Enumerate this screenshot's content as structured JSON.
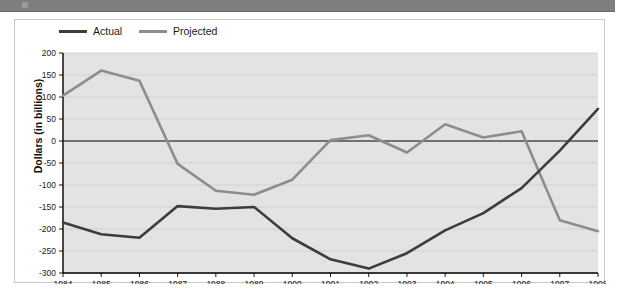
{
  "banner": {
    "name": "top-gray-banner",
    "color": "#7f7f7f"
  },
  "legend": {
    "position": "top-left",
    "entries": [
      {
        "label": "Actual",
        "color": "#3c3c3c"
      },
      {
        "label": "Projected",
        "color": "#8d8d8d"
      }
    ]
  },
  "chart_data": {
    "type": "line",
    "title": "",
    "xlabel": "",
    "ylabel": "Dollars (in billions)",
    "categories": [
      "1984",
      "1985",
      "1986",
      "1987",
      "1988",
      "1989",
      "1990",
      "1991",
      "1992",
      "1993",
      "1994",
      "1995",
      "1996",
      "1997",
      "1998"
    ],
    "x": [
      1984,
      1985,
      1986,
      1987,
      1988,
      1989,
      1990,
      1991,
      1992,
      1993,
      1994,
      1995,
      1996,
      1997,
      1998
    ],
    "series": [
      {
        "name": "Actual",
        "color": "#3c3c3c",
        "values": [
          -185,
          -212,
          -220,
          -148,
          -154,
          -150,
          -221,
          -269,
          -290,
          -255,
          -203,
          -164,
          -107,
          -22,
          73
        ]
      },
      {
        "name": "Projected",
        "color": "#8d8d8d",
        "values": [
          103,
          160,
          137,
          -52,
          -113,
          -122,
          -88,
          2,
          13,
          -26,
          38,
          8,
          22,
          -180,
          -205
        ]
      }
    ],
    "ylim": [
      -300,
      200
    ],
    "ytick_values": [
      200,
      150,
      100,
      50,
      0,
      -50,
      -100,
      -150,
      -200,
      -250,
      -300
    ],
    "ytick_labels": [
      "200",
      "150",
      "100",
      "50",
      "0",
      "-50",
      "-100",
      "-150",
      "-200",
      "-250",
      "-300"
    ],
    "grid": true,
    "grid_axis": "y",
    "legend_position": "top-left",
    "plot_background": "#e3e3e3",
    "zero_line": true
  }
}
